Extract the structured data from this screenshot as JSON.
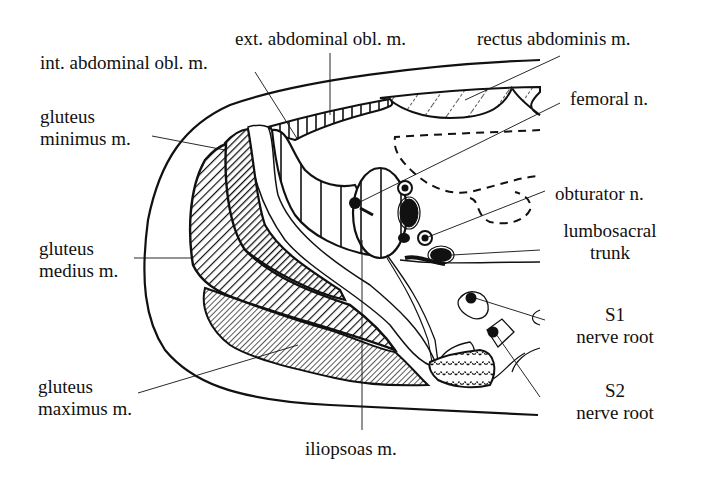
{
  "diagram": {
    "type": "anatomical cross-section",
    "labels": {
      "ext_abdominal_obl": "ext. abdominal obl. m.",
      "int_abdominal_obl": "int. abdominal obl. m.",
      "rectus_abdominis": "rectus abdominis m.",
      "femoral_n": "femoral n.",
      "gluteus_minimus_1": "gluteus",
      "gluteus_minimus_2": "minimus m.",
      "obturator_n": "obturator n.",
      "gluteus_medius_1": "gluteus",
      "gluteus_medius_2": "medius m.",
      "lumbosacral_1": "lumbosacral",
      "lumbosacral_2": "trunk",
      "s1_1": "S1",
      "s1_2": "nerve root",
      "s2_1": "S2",
      "s2_2": "nerve root",
      "gluteus_maximus_1": "gluteus",
      "gluteus_maximus_2": "maximus m.",
      "iliopsoas": "iliopsoas m."
    },
    "colors": {
      "ink": "#111111",
      "background": "#ffffff"
    }
  }
}
